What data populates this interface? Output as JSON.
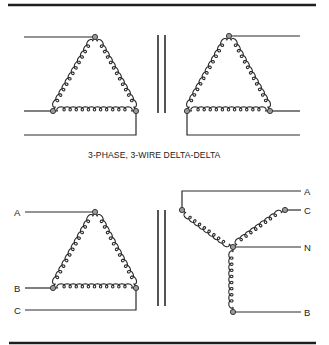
{
  "caption": "3-PHASE,  3-WIRE  DELTA-DELTA",
  "colors": {
    "line": "#2a2a2a",
    "node_fill": "#9a9a9a",
    "background": "#ffffff"
  },
  "diagrams": {
    "top_left_delta": {
      "type": "delta",
      "role": "primary",
      "terminals": []
    },
    "top_right_delta": {
      "type": "delta",
      "role": "secondary",
      "terminals": []
    },
    "bottom_left_delta": {
      "type": "delta",
      "role": "primary",
      "terminals": [
        "A",
        "B",
        "C"
      ]
    },
    "bottom_right_wye": {
      "type": "wye",
      "role": "secondary",
      "terminals": [
        "A",
        "C",
        "N",
        "B"
      ]
    }
  },
  "labels": {
    "bl_a": "A",
    "bl_b": "B",
    "bl_c": "C",
    "br_a": "A",
    "br_c": "C",
    "br_n": "N",
    "br_b": "B"
  }
}
